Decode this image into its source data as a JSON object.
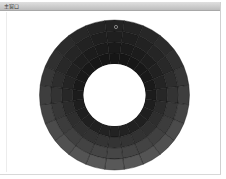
{
  "window": {
    "title": "主窗口"
  },
  "wheel": {
    "center": [
      114.5,
      95
    ],
    "outer_radius": 75,
    "inner_radius": 31,
    "segments": 24,
    "bands": 4,
    "marker": {
      "x": 116,
      "y": 27,
      "label": "selection-marker"
    },
    "colors": {
      "top_inner": "#161616",
      "top_outer": "#232323",
      "bottom_inner": "#222222",
      "bottom_outer": "#585858",
      "grid_line": "#101010",
      "hole": "#ffffff"
    }
  }
}
